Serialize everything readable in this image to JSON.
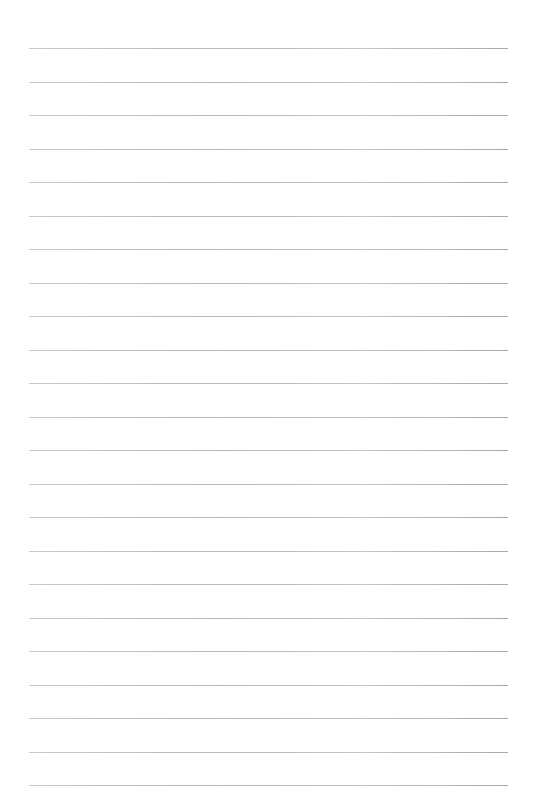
{
  "page": {
    "type": "lined-paper",
    "background_color": "#ffffff",
    "rule_color": "#bdbdbd",
    "rules": {
      "count": 23,
      "first_y": 48,
      "spacing": 33.5,
      "x_start": 29,
      "x_end": 508
    }
  }
}
